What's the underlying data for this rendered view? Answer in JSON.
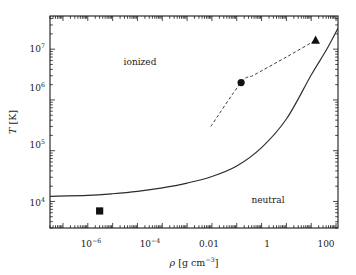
{
  "chart_data": {
    "type": "line",
    "title": "",
    "xlabel": "ρ [g cm⁻³]",
    "ylabel": "T [K]",
    "xscale": "log",
    "yscale": "log",
    "xlim": [
      3e-09,
      1200
    ],
    "ylim": [
      3000,
      45000000
    ],
    "grid": false,
    "legend": null,
    "xticklabels": [
      "10−6",
      "10−4",
      "0.01",
      "1",
      "100"
    ],
    "xtickvalues": [
      1e-06,
      0.0001,
      0.01,
      1,
      100
    ],
    "yticklabels": [
      "10⁴",
      "10⁵",
      "10⁶",
      "10⁷"
    ],
    "ytickvalues": [
      10000,
      100000,
      1000000,
      10000000
    ],
    "annotations": [
      {
        "text": "ionized",
        "x": 3e-05,
        "y": 7500000
      },
      {
        "text": "neutral",
        "x": 20,
        "y": 15000
      }
    ],
    "series": [
      {
        "name": "ionization-boundary",
        "style": "solid",
        "color": "#2b2b2b",
        "points": [
          {
            "x": 3e-09,
            "y": 12600
          },
          {
            "x": 1e-07,
            "y": 13200
          },
          {
            "x": 1e-06,
            "y": 14200
          },
          {
            "x": 1e-05,
            "y": 15800
          },
          {
            "x": 0.0001,
            "y": 18500
          },
          {
            "x": 0.001,
            "y": 23000
          },
          {
            "x": 0.01,
            "y": 31000
          },
          {
            "x": 0.1,
            "y": 50000
          },
          {
            "x": 1,
            "y": 115000
          },
          {
            "x": 10,
            "y": 420000
          },
          {
            "x": 100,
            "y": 3100000
          },
          {
            "x": 400,
            "y": 9500000
          },
          {
            "x": 1200,
            "y": 26000000
          }
        ]
      },
      {
        "name": "evolution-track",
        "style": "dashed",
        "color": "#2b2b2b",
        "points": [
          {
            "x": 0.009,
            "y": 300000
          },
          {
            "x": 0.15,
            "y": 2200000
          },
          {
            "x": 0.5,
            "y": 3100000
          },
          {
            "x": 10,
            "y": 7000000
          },
          {
            "x": 150,
            "y": 15000000
          }
        ]
      }
    ],
    "markers": [
      {
        "name": "square-marker",
        "shape": "square",
        "x": 3e-07,
        "y": 6500,
        "filled": true,
        "color": "#111111"
      },
      {
        "name": "circle-marker",
        "shape": "circle",
        "x": 0.15,
        "y": 2200000,
        "filled": true,
        "color": "#111111"
      },
      {
        "name": "triangle-marker",
        "shape": "triangle",
        "x": 150,
        "y": 15000000,
        "filled": true,
        "color": "#111111"
      }
    ]
  },
  "axes": {
    "x_title_rho": "ρ",
    "x_title_unit": "[g cm",
    "x_title_exp": "−3",
    "x_title_close": "]",
    "y_title_T": "T",
    "y_title_unit": "[K]"
  },
  "labels": {
    "ionized": "ionized",
    "neutral": "neutral",
    "x_tick_1_base": "10",
    "x_tick_1_exp": "−6",
    "x_tick_2_base": "10",
    "x_tick_2_exp": "−4",
    "x_tick_3": "0.01",
    "x_tick_4": "1",
    "x_tick_5": "100",
    "y_tick_1_base": "10",
    "y_tick_1_exp": "4",
    "y_tick_2_base": "10",
    "y_tick_2_exp": "5",
    "y_tick_3_base": "10",
    "y_tick_3_exp": "6",
    "y_tick_4_base": "10",
    "y_tick_4_exp": "7"
  }
}
